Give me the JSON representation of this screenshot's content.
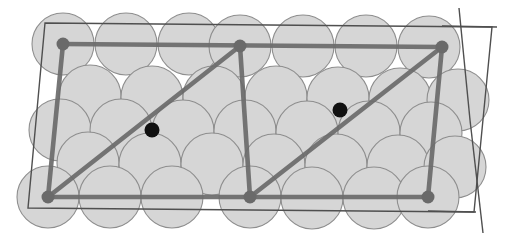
{
  "figure": {
    "canvas": {
      "width": 520,
      "height": 252,
      "background": "#ffffff"
    },
    "colors": {
      "sphere_fill": "#d6d6d6",
      "sphere_stroke": "#8e8e8e",
      "cell_outline": "#4f4f4f",
      "lattice_vector": "#6a6a6a",
      "corner_node": "#6a6a6a",
      "interior_node": "#111111"
    },
    "sphere_radius": 31,
    "node_radius_corner": 6.5,
    "node_radius_interior": 7.5,
    "spheres": [
      {
        "cx": 63,
        "cy": 44
      },
      {
        "cx": 126,
        "cy": 44
      },
      {
        "cx": 189,
        "cy": 44
      },
      {
        "cx": 240,
        "cy": 46
      },
      {
        "cx": 303,
        "cy": 46
      },
      {
        "cx": 366,
        "cy": 46
      },
      {
        "cx": 429,
        "cy": 47
      },
      {
        "cx": 90,
        "cy": 96
      },
      {
        "cx": 152,
        "cy": 97
      },
      {
        "cx": 214,
        "cy": 97
      },
      {
        "cx": 276,
        "cy": 97
      },
      {
        "cx": 338,
        "cy": 98
      },
      {
        "cx": 400,
        "cy": 99
      },
      {
        "cx": 458,
        "cy": 100
      },
      {
        "cx": 60,
        "cy": 130
      },
      {
        "cx": 121,
        "cy": 130
      },
      {
        "cx": 183,
        "cy": 131
      },
      {
        "cx": 245,
        "cy": 131
      },
      {
        "cx": 307,
        "cy": 132
      },
      {
        "cx": 369,
        "cy": 132
      },
      {
        "cx": 431,
        "cy": 133
      },
      {
        "cx": 88,
        "cy": 163
      },
      {
        "cx": 150,
        "cy": 164
      },
      {
        "cx": 212,
        "cy": 164
      },
      {
        "cx": 274,
        "cy": 165
      },
      {
        "cx": 336,
        "cy": 165
      },
      {
        "cx": 398,
        "cy": 166
      },
      {
        "cx": 455,
        "cy": 167
      },
      {
        "cx": 48,
        "cy": 197
      },
      {
        "cx": 110,
        "cy": 197
      },
      {
        "cx": 172,
        "cy": 197
      },
      {
        "cx": 250,
        "cy": 197
      },
      {
        "cx": 312,
        "cy": 198
      },
      {
        "cx": 374,
        "cy": 198
      },
      {
        "cx": 428,
        "cy": 197
      }
    ],
    "cell_outline_path": "M45,23 L492,27 L474,212 L28,208 Z",
    "axis_extensions": [
      {
        "name": "top-horizontal-extension",
        "x1": 442,
        "y1": 26,
        "x2": 497,
        "y2": 27
      },
      {
        "name": "right-slant-extension-top",
        "x1": 459,
        "y1": 8,
        "x2": 470,
        "y2": 120
      },
      {
        "name": "right-slant-extension-bottom",
        "x1": 470,
        "y1": 120,
        "x2": 483,
        "y2": 233
      },
      {
        "name": "bottom-horizontal-extension",
        "x1": 428,
        "y1": 211,
        "x2": 476,
        "y2": 212
      }
    ],
    "lattice_vectors": [
      {
        "name": "a-top-edge",
        "x1": 63,
        "y1": 44,
        "x2": 442,
        "y2": 47
      },
      {
        "name": "a-bottom-edge",
        "x1": 48,
        "y1": 197,
        "x2": 428,
        "y2": 197
      },
      {
        "name": "c-left-edge",
        "x1": 63,
        "y1": 44,
        "x2": 48,
        "y2": 197
      },
      {
        "name": "c-middle-edge",
        "x1": 240,
        "y1": 46,
        "x2": 250,
        "y2": 197
      },
      {
        "name": "c-right-edge",
        "x1": 442,
        "y1": 47,
        "x2": 428,
        "y2": 197
      },
      {
        "name": "diagonal-left",
        "x1": 48,
        "y1": 197,
        "x2": 240,
        "y2": 46
      },
      {
        "name": "diagonal-right",
        "x1": 250,
        "y1": 197,
        "x2": 442,
        "y2": 47
      }
    ],
    "corner_nodes": [
      {
        "name": "node-top-left",
        "cx": 63,
        "cy": 44
      },
      {
        "name": "node-top-middle",
        "cx": 240,
        "cy": 46
      },
      {
        "name": "node-top-right",
        "cx": 442,
        "cy": 47
      },
      {
        "name": "node-bottom-left",
        "cx": 48,
        "cy": 197
      },
      {
        "name": "node-bottom-middle",
        "cx": 250,
        "cy": 197
      },
      {
        "name": "node-bottom-right",
        "cx": 428,
        "cy": 197
      }
    ],
    "interior_nodes": [
      {
        "name": "interior-node-left",
        "cx": 152,
        "cy": 130
      },
      {
        "name": "interior-node-right",
        "cx": 340,
        "cy": 110
      }
    ]
  }
}
